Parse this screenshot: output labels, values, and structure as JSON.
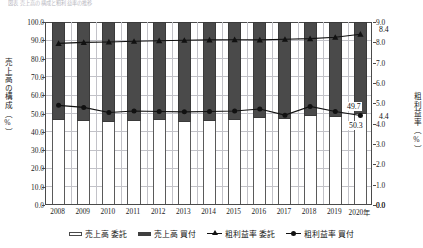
{
  "caption": "図表  売上高の構成と粗利益率の推移",
  "axes": {
    "y_left_title": "売上高の構成（%）",
    "y_right_title": "粗利益率（%）",
    "y_left_ticks": [
      "100.0",
      "90.0",
      "80.0",
      "70.0",
      "60.0",
      "50.0",
      "40.0",
      "30.0",
      "20.0",
      "10.0",
      "0.0"
    ],
    "y_right_ticks": [
      "9.0",
      "8.0",
      "7.0",
      "6.0",
      "5.0",
      "4.0",
      "3.0",
      "2.0",
      "1.0",
      "0.0"
    ],
    "x_ticks": [
      "2008",
      "2009",
      "2010",
      "2011",
      "2012",
      "2013",
      "2014",
      "2015",
      "2016",
      "2017",
      "2018",
      "2019",
      "2020年"
    ]
  },
  "legend": [
    {
      "label": "売上高 委託",
      "marker": "hollow-bar-swatch"
    },
    {
      "label": "売上高 買付",
      "marker": "solid-bar-swatch"
    },
    {
      "label": "粗利益率 委託",
      "marker": "triangle-line-swatch"
    },
    {
      "label": "粗利益率 買付",
      "marker": "circle-line-swatch"
    }
  ],
  "callouts": [
    {
      "name": "gross-margin-itaku-end",
      "text": "8.4"
    },
    {
      "name": "sales-kaitsuke-end",
      "text": "50.3"
    },
    {
      "name": "gross-margin-kaitsuke-end",
      "text": "4.4"
    },
    {
      "name": "sales-itaku-end",
      "text": "49.7"
    }
  ],
  "chart_data": {
    "type": "bar",
    "title": "売上高の構成と粗利益率の推移",
    "xlabel": "",
    "ylabel": "売上高の構成（%）",
    "y2label": "粗利益率（%）",
    "ylim": [
      0,
      100
    ],
    "y2lim": [
      0,
      9
    ],
    "grid": true,
    "legend_position": "bottom",
    "stacked": true,
    "categories": [
      "2008",
      "2009",
      "2010",
      "2011",
      "2012",
      "2013",
      "2014",
      "2015",
      "2016",
      "2017",
      "2018",
      "2019",
      "2020"
    ],
    "series": [
      {
        "name": "売上高 委託",
        "type": "bar",
        "axis": "left",
        "stack": "sales",
        "values": [
          46.5,
          46.0,
          45.5,
          46.0,
          46.5,
          45.5,
          46.0,
          46.5,
          47.5,
          47.0,
          48.5,
          48.0,
          49.7
        ]
      },
      {
        "name": "売上高 買付",
        "type": "bar",
        "axis": "left",
        "stack": "sales",
        "values": [
          53.5,
          54.0,
          54.5,
          54.0,
          53.5,
          54.5,
          54.0,
          53.5,
          52.5,
          53.0,
          51.5,
          52.0,
          50.3
        ]
      },
      {
        "name": "粗利益率 委託",
        "type": "line",
        "axis": "right",
        "marker": "triangle",
        "values": [
          7.95,
          8.0,
          8.02,
          8.05,
          8.08,
          8.1,
          8.12,
          8.13,
          8.12,
          8.15,
          8.18,
          8.25,
          8.4
        ]
      },
      {
        "name": "粗利益率 買付",
        "type": "line",
        "axis": "right",
        "marker": "circle",
        "values": [
          4.9,
          4.8,
          4.55,
          4.62,
          4.6,
          4.58,
          4.6,
          4.62,
          4.72,
          4.42,
          4.85,
          4.6,
          4.4
        ]
      }
    ]
  },
  "colors": {
    "bar_solid": "#4a4a4a",
    "bar_hollow": "#ffffff",
    "bar_stroke": "#5a5a5a",
    "line": "#111111",
    "grid": "#c2c2c8",
    "axis": "#4a4a4a",
    "text": "#1b1b1b"
  }
}
